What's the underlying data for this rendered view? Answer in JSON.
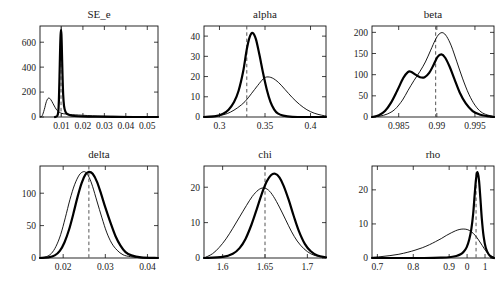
{
  "figure": {
    "background": "#ffffff",
    "layout": "2 rows x 3 columns of density plots",
    "series_styles": {
      "prior_label": "prior (thin line)",
      "posterior_label": "posterior (thick line)",
      "mode_line_label": "posterior mode (dashed vertical line)",
      "prior_color": "#000000",
      "posterior_color": "#000000",
      "mode_line_color": "#555555"
    }
  },
  "chart_data": [
    {
      "type": "line",
      "title": "SE_e",
      "xlabel": "",
      "ylabel": "",
      "xlim": [
        0.0,
        0.055
      ],
      "ylim": [
        0,
        730
      ],
      "xticks": [
        0.01,
        0.02,
        0.03,
        0.04,
        0.05
      ],
      "xticklabels": [
        "0.01",
        "0.02",
        "0.03",
        "0.04",
        "0.05"
      ],
      "yticks": [
        0,
        200,
        400,
        600
      ],
      "yticklabels": [
        "0",
        "200",
        "400",
        "600"
      ],
      "grid": false,
      "legend": "none",
      "mode_line_x": 0.0098,
      "series": [
        {
          "name": "prior",
          "x": [
            0.0,
            0.001,
            0.002,
            0.003,
            0.004,
            0.005,
            0.006,
            0.007,
            0.008,
            0.009,
            0.01,
            0.011,
            0.012,
            0.013,
            0.015,
            0.018,
            0.022,
            0.027,
            0.033,
            0.04,
            0.048,
            0.055
          ],
          "values": [
            0,
            10,
            60,
            125,
            152,
            140,
            110,
            78,
            52,
            38,
            30,
            26,
            24,
            22,
            19,
            16,
            12,
            9,
            6,
            4,
            2,
            1
          ]
        },
        {
          "name": "posterior",
          "x": [
            0.007,
            0.008,
            0.0085,
            0.0088,
            0.0091,
            0.0094,
            0.0096,
            0.0098,
            0.01,
            0.0102,
            0.0105,
            0.0108,
            0.0112,
            0.0118,
            0.0126,
            0.014,
            0.016,
            0.02,
            0.026,
            0.034,
            0.044,
            0.055
          ],
          "values": [
            0,
            8,
            40,
            130,
            330,
            560,
            660,
            700,
            660,
            540,
            330,
            180,
            90,
            45,
            25,
            14,
            8,
            4,
            2,
            1,
            0,
            0
          ]
        }
      ]
    },
    {
      "type": "line",
      "title": "alpha",
      "xlabel": "",
      "ylabel": "",
      "xlim": [
        0.283,
        0.417
      ],
      "ylim": [
        0,
        45
      ],
      "xticks": [
        0.3,
        0.35,
        0.4
      ],
      "xticklabels": [
        "0.3",
        "0.35",
        "0.4"
      ],
      "yticks": [
        0,
        10,
        20,
        30,
        40
      ],
      "yticklabels": [
        "0",
        "10",
        "20",
        "30",
        "40"
      ],
      "grid": false,
      "legend": "none",
      "mode_line_x": 0.33,
      "series": [
        {
          "name": "prior",
          "x": [
            0.283,
            0.295,
            0.305,
            0.312,
            0.32,
            0.328,
            0.335,
            0.342,
            0.348,
            0.352,
            0.358,
            0.365,
            0.372,
            0.38,
            0.388,
            0.396,
            0.404,
            0.412,
            0.417
          ],
          "values": [
            0,
            0.4,
            1.2,
            2.4,
            4.6,
            7.6,
            11.5,
            15.6,
            18.8,
            19.8,
            19.3,
            17.0,
            13.6,
            9.6,
            6.2,
            3.6,
            1.9,
            0.9,
            0.5
          ]
        },
        {
          "name": "posterior",
          "x": [
            0.283,
            0.296,
            0.304,
            0.31,
            0.316,
            0.321,
            0.326,
            0.33,
            0.3335,
            0.3365,
            0.34,
            0.344,
            0.348,
            0.352,
            0.356,
            0.36,
            0.364,
            0.37,
            0.38,
            0.4,
            0.417
          ],
          "values": [
            0,
            0.4,
            1.6,
            3.6,
            7.4,
            13.0,
            22.5,
            33.5,
            40.0,
            41.5,
            38.5,
            30.5,
            21.5,
            13.5,
            7.5,
            3.8,
            1.8,
            0.7,
            0.1,
            0.0,
            0.0
          ]
        }
      ]
    },
    {
      "type": "line",
      "title": "beta",
      "xlabel": "",
      "ylabel": "",
      "xlim": [
        0.9815,
        0.9975
      ],
      "ylim": [
        0,
        215
      ],
      "xticks": [
        0.985,
        0.99,
        0.995
      ],
      "xticklabels": [
        "0.985",
        "0.99",
        "0.995"
      ],
      "yticks": [
        0,
        50,
        100,
        150,
        200
      ],
      "yticklabels": [
        "0",
        "50",
        "100",
        "150",
        "200"
      ],
      "grid": false,
      "legend": "none",
      "mode_line_x": 0.98985,
      "series": [
        {
          "name": "prior",
          "x": [
            0.9815,
            0.9825,
            0.9835,
            0.9845,
            0.9855,
            0.9862,
            0.987,
            0.9878,
            0.9885,
            0.9892,
            0.9898,
            0.9903,
            0.9908,
            0.9913,
            0.9919,
            0.9926,
            0.9934,
            0.9942,
            0.995,
            0.9958,
            0.9966,
            0.9975
          ],
          "values": [
            0,
            2,
            7,
            18,
            40,
            62,
            86,
            108,
            130,
            158,
            182,
            196,
            199,
            190,
            168,
            132,
            90,
            54,
            28,
            12,
            5,
            1
          ]
        },
        {
          "name": "posterior",
          "x": [
            0.9815,
            0.9824,
            0.9832,
            0.984,
            0.9848,
            0.9856,
            0.9862,
            0.9866,
            0.9872,
            0.9878,
            0.9884,
            0.989,
            0.9896,
            0.9901,
            0.9906,
            0.9911,
            0.9917,
            0.9923,
            0.993,
            0.9938,
            0.9947,
            0.9956,
            0.9966,
            0.9975
          ],
          "values": [
            0,
            4,
            14,
            34,
            62,
            92,
            106,
            107,
            100,
            94,
            94,
            104,
            124,
            142,
            148,
            140,
            118,
            90,
            58,
            32,
            14,
            6,
            2,
            0
          ]
        }
      ]
    },
    {
      "type": "line",
      "title": "delta",
      "xlabel": "",
      "ylabel": "",
      "xlim": [
        0.0145,
        0.0425
      ],
      "ylim": [
        0,
        142
      ],
      "xticks": [
        0.02,
        0.03,
        0.04
      ],
      "xticklabels": [
        "0.02",
        "0.03",
        "0.04"
      ],
      "yticks": [
        0,
        50,
        100
      ],
      "yticklabels": [
        "0",
        "50",
        "100"
      ],
      "grid": false,
      "legend": "none",
      "mode_line_x": 0.0261,
      "series": [
        {
          "name": "prior",
          "x": [
            0.0145,
            0.016,
            0.0172,
            0.0183,
            0.0194,
            0.0205,
            0.0216,
            0.0227,
            0.0238,
            0.0247,
            0.0254,
            0.0262,
            0.027,
            0.028,
            0.0292,
            0.0303,
            0.0315,
            0.0328,
            0.0342,
            0.036,
            0.039,
            0.0425
          ],
          "values": [
            0,
            2,
            7,
            18,
            36,
            62,
            90,
            113,
            128,
            133,
            132,
            124,
            110,
            88,
            62,
            40,
            23,
            12,
            5,
            2,
            0,
            0
          ]
        },
        {
          "name": "posterior",
          "x": [
            0.0145,
            0.0165,
            0.018,
            0.0192,
            0.0203,
            0.0214,
            0.0224,
            0.0234,
            0.0244,
            0.0253,
            0.0261,
            0.027,
            0.028,
            0.029,
            0.03,
            0.0312,
            0.0324,
            0.0336,
            0.0348,
            0.0362,
            0.0385,
            0.0425
          ],
          "values": [
            0,
            1,
            4,
            11,
            24,
            44,
            68,
            94,
            116,
            129,
            133,
            130,
            118,
            99,
            78,
            55,
            34,
            19,
            9,
            4,
            1,
            0
          ]
        }
      ]
    },
    {
      "type": "line",
      "title": "chi",
      "xlabel": "",
      "ylabel": "",
      "xlim": [
        1.578,
        1.722
      ],
      "ylim": [
        0,
        26
      ],
      "xticks": [
        1.6,
        1.65,
        1.7
      ],
      "xticklabels": [
        "1.6",
        "1.65",
        "1.7"
      ],
      "yticks": [
        0,
        10,
        20
      ],
      "yticklabels": [
        "0",
        "10",
        "20"
      ],
      "grid": false,
      "legend": "none",
      "mode_line_x": 1.65,
      "series": [
        {
          "name": "prior",
          "x": [
            1.578,
            1.588,
            1.596,
            1.604,
            1.612,
            1.62,
            1.628,
            1.635,
            1.642,
            1.648,
            1.654,
            1.66,
            1.667,
            1.674,
            1.681,
            1.688,
            1.696,
            1.704,
            1.712,
            1.722
          ],
          "values": [
            0,
            1.2,
            3.0,
            5.4,
            8.4,
            11.6,
            14.8,
            17.4,
            19.2,
            19.8,
            19.2,
            17.4,
            14.4,
            11.0,
            7.6,
            4.8,
            2.6,
            1.2,
            0.5,
            0.1
          ]
        },
        {
          "name": "posterior",
          "x": [
            1.578,
            1.6,
            1.612,
            1.62,
            1.627,
            1.634,
            1.64,
            1.646,
            1.652,
            1.657,
            1.662,
            1.667,
            1.672,
            1.678,
            1.684,
            1.69,
            1.697,
            1.704,
            1.712,
            1.722
          ],
          "values": [
            0,
            0.3,
            1.2,
            2.8,
            5.4,
            9.4,
            13.6,
            18.0,
            21.6,
            23.4,
            23.8,
            22.8,
            20.4,
            16.4,
            11.8,
            7.6,
            4.0,
            1.9,
            0.7,
            0.2
          ]
        }
      ]
    },
    {
      "type": "line",
      "title": "rho",
      "xlabel": "",
      "ylabel": "",
      "xlim": [
        0.685,
        1.025
      ],
      "ylim": [
        0,
        27
      ],
      "xticks": [
        0.7,
        0.8,
        0.9,
        0.95,
        1.0
      ],
      "xticklabels": [
        "0.7",
        "0.8",
        "0.9",
        "0",
        "1"
      ],
      "yticks": [
        0,
        10,
        20
      ],
      "yticklabels": [
        "0",
        "10",
        "20"
      ],
      "grid": false,
      "legend": "none",
      "mode_line_x": 0.975,
      "series": [
        {
          "name": "prior",
          "x": [
            0.685,
            0.71,
            0.735,
            0.76,
            0.785,
            0.805,
            0.825,
            0.845,
            0.862,
            0.878,
            0.892,
            0.906,
            0.918,
            0.93,
            0.941,
            0.952,
            0.962,
            0.972,
            0.982,
            0.992,
            1.002,
            1.012,
            1.025
          ],
          "values": [
            0.2,
            0.4,
            0.7,
            1.1,
            1.7,
            2.3,
            3.0,
            3.9,
            4.8,
            5.7,
            6.6,
            7.4,
            8.0,
            8.4,
            8.5,
            8.3,
            7.7,
            6.7,
            5.3,
            3.7,
            2.1,
            0.9,
            0.2
          ]
        },
        {
          "name": "posterior",
          "x": [
            0.685,
            0.83,
            0.88,
            0.905,
            0.92,
            0.932,
            0.941,
            0.949,
            0.956,
            0.962,
            0.967,
            0.971,
            0.975,
            0.979,
            0.983,
            0.987,
            0.991,
            0.996,
            1.002,
            1.01,
            1.018,
            1.025
          ],
          "values": [
            0,
            0,
            0.1,
            0.3,
            0.6,
            1.1,
            1.9,
            3.2,
            5.4,
            8.6,
            13.0,
            18.4,
            23.2,
            25.2,
            23.0,
            17.6,
            11.6,
            6.4,
            3.0,
            1.1,
            0.3,
            0.0
          ]
        }
      ]
    }
  ]
}
